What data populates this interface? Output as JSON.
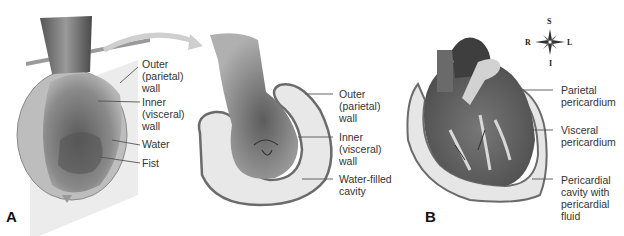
{
  "figure": {
    "panels": [
      {
        "id": "A",
        "letter": "A",
        "subject": "fist pushed into water-filled balloon analogy",
        "left_labels": [
          {
            "text": "Outer\n(parietal)\nwall"
          },
          {
            "text": "Inner\n(visceral)\nwall"
          },
          {
            "text": "Water"
          },
          {
            "text": "Fist"
          }
        ],
        "cutaway_labels": [
          {
            "text": "Outer\n(parietal)\nwall"
          },
          {
            "text": "Inner\n(visceral)\nwall"
          },
          {
            "text": "Water-filled\ncavity"
          }
        ]
      },
      {
        "id": "B",
        "letter": "B",
        "subject": "heart within pericardium",
        "labels": [
          {
            "text": "Parietal\npericardium"
          },
          {
            "text": "Visceral\npericardium"
          },
          {
            "text": "Pericardial\ncavity with\npericardial\nfluid"
          }
        ],
        "compass": {
          "top": "S",
          "bottom": "I",
          "left": "R",
          "right": "L"
        }
      }
    ],
    "colors": {
      "outline": "#6b6b6b",
      "sac_fill": "#e8e8e8",
      "heart_dark": "#4a4a4a",
      "heart_mid": "#7a7a7a",
      "leader_line": "#555555",
      "text": "#333333"
    }
  }
}
